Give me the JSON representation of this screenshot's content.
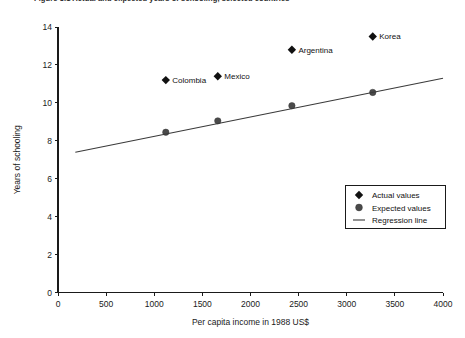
{
  "figure": {
    "clipped_title": "Figure 3.1  Actual and expected years of schooling, selected countries",
    "background_color": "#ffffff",
    "ink_color": "#111111"
  },
  "chart_data": {
    "type": "scatter",
    "title": "",
    "xlabel": "Per capita income in 1988 US$",
    "ylabel": "Years of schooling",
    "xlim": [
      0,
      4000
    ],
    "ylim": [
      0,
      14
    ],
    "xticks": [
      0,
      500,
      1000,
      1500,
      2000,
      2500,
      3000,
      3500,
      4000
    ],
    "xtick_labels": [
      "0",
      "500",
      "1000",
      "1500",
      "2000",
      "2500",
      "3000",
      "3500",
      "4000"
    ],
    "yticks": [
      0,
      2,
      4,
      6,
      8,
      10,
      12,
      14
    ],
    "ytick_labels": [
      "0",
      "2",
      "4",
      "6",
      "8",
      "10",
      "12",
      "14"
    ],
    "grid": false,
    "legend_position": "lower-right",
    "series": [
      {
        "name": "Actual values",
        "marker": "diamond",
        "color": "#111111",
        "points": [
          {
            "label": "Colombia",
            "x": 1120,
            "y": 11.2,
            "label_side": "right"
          },
          {
            "label": "Mexico",
            "x": 1660,
            "y": 11.4,
            "label_side": "right"
          },
          {
            "label": "Argentina",
            "x": 2430,
            "y": 12.8,
            "label_side": "right"
          },
          {
            "label": "Korea",
            "x": 3270,
            "y": 13.5,
            "label_side": "right"
          }
        ]
      },
      {
        "name": "Expected values",
        "marker": "circle",
        "color": "#4a4a4a",
        "points": [
          {
            "label": "",
            "x": 1120,
            "y": 8.45
          },
          {
            "label": "",
            "x": 1660,
            "y": 9.05
          },
          {
            "label": "",
            "x": 2430,
            "y": 9.85
          },
          {
            "label": "",
            "x": 3270,
            "y": 10.55
          }
        ]
      },
      {
        "name": "Regression line",
        "marker": "line",
        "color": "#3a3a3a",
        "points": [
          {
            "label": "",
            "x": 180,
            "y": 7.4
          },
          {
            "label": "",
            "x": 4000,
            "y": 11.3
          }
        ]
      }
    ],
    "legend_entries": [
      {
        "label": "Actual values",
        "marker": "diamond"
      },
      {
        "label": "Expected values",
        "marker": "circle"
      },
      {
        "label": "Regression line",
        "marker": "line"
      }
    ]
  }
}
